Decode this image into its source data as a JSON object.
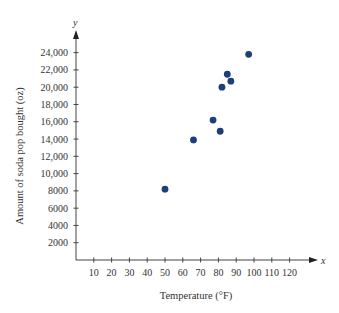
{
  "chart_data": {
    "type": "scatter",
    "title": "",
    "xlabel": "Temperature (°F)",
    "ylabel": "Amount of soda pop bought (oz)",
    "x_axis_var": "x",
    "y_axis_var": "y",
    "xlim": [
      0,
      125
    ],
    "ylim": [
      0,
      25500
    ],
    "x_ticks": [
      10,
      20,
      30,
      40,
      50,
      60,
      70,
      80,
      90,
      100,
      110,
      120
    ],
    "y_ticks": [
      2000,
      4000,
      6000,
      8000,
      10000,
      12000,
      14000,
      16000,
      18000,
      20000,
      22000,
      24000
    ],
    "y_tick_labels": [
      "2000",
      "4000",
      "6000",
      "8000",
      "10,000",
      "12,000",
      "14,000",
      "16,000",
      "18,000",
      "20,000",
      "22,000",
      "24,000"
    ],
    "grid": false,
    "legend": null,
    "marker_color": "#1a3f7a",
    "points": [
      {
        "x": 50,
        "y": 8200
      },
      {
        "x": 66,
        "y": 13900
      },
      {
        "x": 77,
        "y": 16200
      },
      {
        "x": 81,
        "y": 14900
      },
      {
        "x": 82,
        "y": 20000
      },
      {
        "x": 85,
        "y": 21500
      },
      {
        "x": 87,
        "y": 20700
      },
      {
        "x": 97,
        "y": 23800
      }
    ]
  }
}
